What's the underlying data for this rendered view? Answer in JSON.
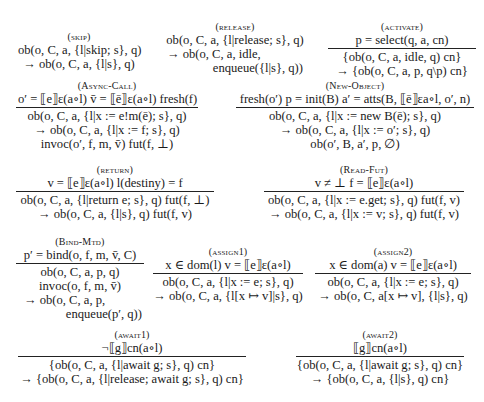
{
  "rules": {
    "skip": {
      "name": "(skip)",
      "lines": [
        "ob(o, C, a, {l|skip; s}, q)",
        "→ ob(o, C, a, {l|s}, q)"
      ]
    },
    "release": {
      "name": "(release)",
      "lines": [
        "ob(o, C, a, {l|release; s}, q)",
        "→ ob(o, C, a, idle,",
        "enqueue({l|s}, q))"
      ]
    },
    "activate": {
      "name": "(activate)",
      "premise": "p = select(q, a, cn)",
      "lines": [
        "{ob(o, C, a, idle, q) cn}",
        "→ {ob(o, C, a, p, q\\p) cn}"
      ]
    },
    "async_call": {
      "name": "(Async-Call)",
      "premise": "o′ = ⟦e⟧ε(a∘l)   v̄ = ⟦ē⟧ε(a∘l) fresh(f)",
      "lines": [
        "ob(o, C, a, {l|x := e!m(ē); s}, q)",
        "→ ob(o, C, a, {l|x := f; s}, q)",
        "invoc(o′, f, m, v̄) fut(f, ⊥)"
      ]
    },
    "new_object": {
      "name": "(New-Object)",
      "premise": "fresh(o′) p = init(B) a′ = atts(B, ⟦ē⟧εa∘l, o′, n)",
      "lines": [
        "ob(o, C, a, {l|x := new B(ē); s}, q)",
        "→ ob(o, C, a, {l|x := o′; s}, q)",
        "ob(o′, B, a′, p, ∅)"
      ]
    },
    "return": {
      "name": "(return)",
      "premise": "v = ⟦e⟧ε(a∘l)   l(destiny) = f",
      "lines": [
        "ob(o, C, a, {l|return e; s}, q) fut(f, ⊥)",
        "→ ob(o, C, a, {l|s}, q) fut(f, v)"
      ]
    },
    "read_fut": {
      "name": "(Read-Fut)",
      "premise": "v ≠ ⊥   f = ⟦e⟧ε(a∘l)",
      "lines": [
        "ob(o, C, a, {l|x := e.get; s}, q) fut(f, v)",
        "→ ob(o, C, a, {l|x := v; s}, q) fut(f, v)"
      ]
    },
    "bind_mtd": {
      "name": "(Bind-Mtd)",
      "premise": "p′ = bind(o, f, m, v̄, C)",
      "lines": [
        "ob(o, C, a, p, q)",
        "invoc(o, f, m, v̄)",
        "→ ob(o, C, a, p,",
        "enqueue(p′, q))"
      ]
    },
    "assign1": {
      "name": "(assign1)",
      "premise": "x ∈ dom(l)   v = ⟦e⟧ε(a∘l)",
      "lines": [
        "ob(o, C, a, {l|x := e; s}, q)",
        "→ ob(o, C, a, {l[x ↦ v]|s}, q)"
      ]
    },
    "assign2": {
      "name": "(assign2)",
      "premise": "x ∈ dom(a)   v = ⟦e⟧ε(a∘l)",
      "lines": [
        "ob(o, C, a, {l|x := e; s}, q)",
        "→ ob(o, C, a[x ↦ v], {l|s}, q)"
      ]
    },
    "await1": {
      "name": "(await1)",
      "premise": "¬⟦g⟧cn(a∘l)",
      "lines": [
        "{ob(o, C, a, {l|await g; s}, q) cn}",
        "→ {ob(o, C, a, {l|release; await g; s}, q) cn}"
      ]
    },
    "await2": {
      "name": "(await2)",
      "premise": "⟦g⟧cn(a∘l)",
      "lines": [
        "{ob(o, C, a, {l|await g; s}, q) cn}",
        "→ {ob(o, C, a, {l|s}, q) cn}"
      ]
    }
  }
}
